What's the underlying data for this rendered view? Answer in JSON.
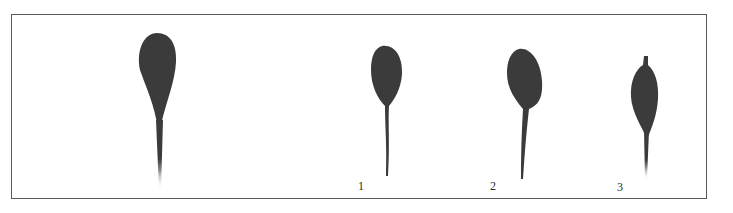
{
  "figure": {
    "frame_color": "#5a5a5a",
    "fill_color": "#3b3b3b",
    "specimens": [
      {
        "id": "reference",
        "label": ""
      },
      {
        "id": "specimen-1",
        "label": "1"
      },
      {
        "id": "specimen-2",
        "label": "2"
      },
      {
        "id": "specimen-3",
        "label": "3"
      }
    ]
  }
}
